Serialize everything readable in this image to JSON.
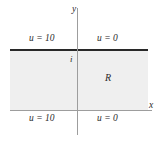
{
  "figure": {
    "type": "math-diagram",
    "colors": {
      "region_fill": "#efefef",
      "top_boundary": "#282828",
      "axis": "#9d9d9d",
      "text": "#2b2b2b",
      "background": "#ffffff"
    },
    "axes": {
      "y_label": "y",
      "x_label": "x"
    },
    "markers": {
      "imaginary_unit": "i"
    },
    "region": {
      "label": "R"
    },
    "boundary_conditions": {
      "top_left": "u = 10",
      "top_right": "u = 0",
      "bottom_left": "u = 10",
      "bottom_right": "u = 0"
    }
  }
}
